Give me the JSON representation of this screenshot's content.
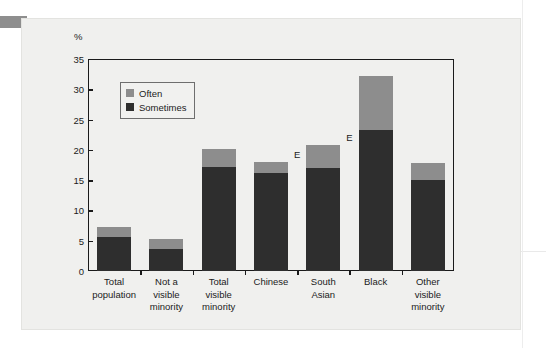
{
  "figure": {
    "y_unit_label": "%",
    "legend": [
      {
        "key": "often",
        "label": "Often",
        "color": "#8d8d8d"
      },
      {
        "key": "sometimes",
        "label": "Sometimes",
        "color": "#2e2e2e"
      }
    ],
    "annotations": [
      {
        "label": "E",
        "category": "Chinese"
      },
      {
        "label": "E",
        "category": "South Asian"
      }
    ],
    "colors": {
      "panel_background": "#f0f0ee",
      "axis": "#1a1a1a",
      "text": "#1b1b1b",
      "corner_tab": "#8e8e8e"
    }
  },
  "chart_data": {
    "type": "bar",
    "title": "",
    "xlabel": "",
    "ylabel": "%",
    "ylim": [
      0,
      35
    ],
    "yticks": [
      0,
      5,
      10,
      15,
      20,
      25,
      30,
      35
    ],
    "ytick_labels": [
      "0",
      "5",
      "10",
      "15",
      "20",
      "25",
      "30",
      "35"
    ],
    "grid": false,
    "stacked": true,
    "legend_position": "top-left-inside",
    "categories": [
      "Total population",
      "Not a visible minority",
      "Total visible minority",
      "Chinese",
      "South Asian",
      "Black",
      "Other visible minority"
    ],
    "category_label_lines": [
      [
        "Total",
        "population"
      ],
      [
        "Not a",
        "visible",
        "minority"
      ],
      [
        "Total",
        "visible",
        "minority"
      ],
      [
        "Chinese"
      ],
      [
        "South",
        "Asian"
      ],
      [
        "Black"
      ],
      [
        "Other",
        "visible",
        "minority"
      ]
    ],
    "series": [
      {
        "name": "Sometimes",
        "color": "#2e2e2e",
        "values": [
          5.6,
          3.6,
          17.2,
          16.2,
          17.0,
          23.2,
          15.0
        ]
      },
      {
        "name": "Often",
        "color": "#8d8d8d",
        "values": [
          1.7,
          1.7,
          2.9,
          1.8,
          3.8,
          9.0,
          2.8
        ]
      }
    ],
    "totals": [
      7.3,
      5.3,
      20.1,
      18.0,
      20.8,
      32.2,
      17.8
    ]
  }
}
